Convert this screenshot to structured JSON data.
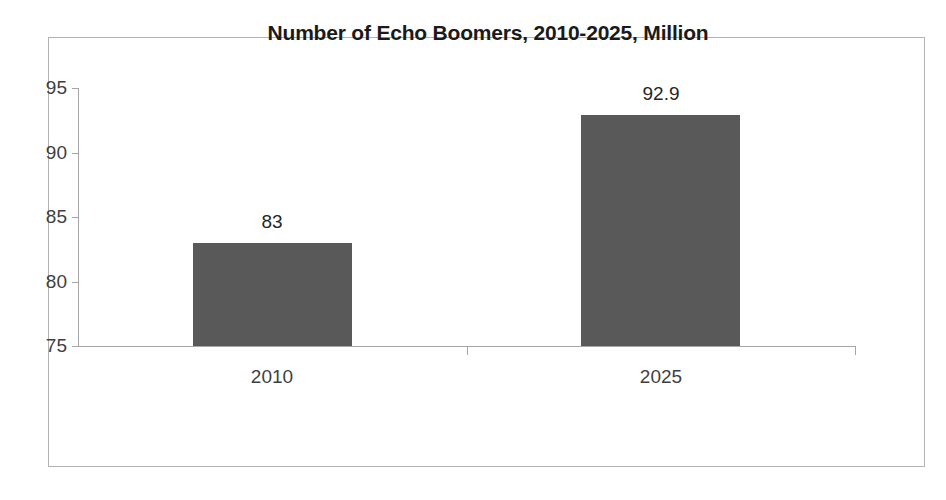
{
  "chart_data": {
    "type": "bar",
    "title": "Number of Echo Boomers, 2010-2025, Million",
    "categories": [
      "2010",
      "2025"
    ],
    "values": [
      83,
      92.9
    ],
    "value_labels": [
      "83",
      "92.9"
    ],
    "xlabel": "",
    "ylabel": "",
    "ylim": [
      75,
      95
    ],
    "yticks": [
      75,
      80,
      85,
      90,
      95
    ],
    "ytick_labels": [
      "75",
      "80",
      "85",
      "90",
      "95"
    ],
    "grid": false,
    "legend": false,
    "series": [
      {
        "name": "Echo Boomers",
        "values": [
          83,
          92.9
        ],
        "color": "#595959"
      }
    ],
    "colors": {
      "bar": "#595959",
      "axis": "#a6a6a6",
      "frame": "#b3b3b3",
      "title_text": "#1a1a1a",
      "tick_text": "#3f3f3f",
      "background": "#ffffff"
    }
  }
}
